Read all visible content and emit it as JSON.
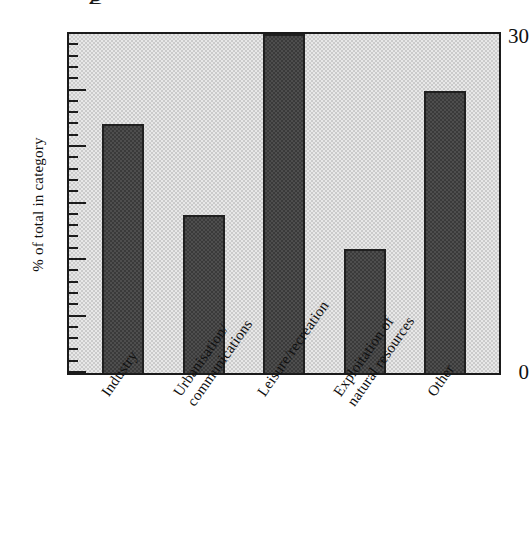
{
  "chart_data": {
    "type": "bar",
    "title": "",
    "subtitle": "",
    "xlabel": "",
    "ylabel": "% of total in category",
    "ylim": [
      0,
      30
    ],
    "ytick_labels": [
      "0",
      "30"
    ],
    "ytick_values": [
      0,
      30
    ],
    "minor_tick_step": 1,
    "major_tick_step": 5,
    "grid": false,
    "legend": null,
    "categories": [
      "Industry",
      "Urbanisation/\ncommunications",
      "Leisure/recreation",
      "Exploitation of\nnatural resources",
      "Other"
    ],
    "values": [
      22,
      14,
      30,
      11,
      25
    ],
    "bar_color": "#3a3a3a",
    "plot_background": "#cbcbcb",
    "axis_color": "#1b1b1b"
  },
  "axes": {
    "y_axis_label": "% of total in category",
    "y_top_label": "30",
    "y_zero_label": "0"
  },
  "categories": {
    "c0_line1": "Industry",
    "c0_line2": "",
    "c1_line1": "Urbanisation/",
    "c1_line2": "communications",
    "c2_line1": "Leisure/recreation",
    "c2_line2": "",
    "c3_line1": "Exploitation of",
    "c3_line2": "natural resources",
    "c4_line1": "Other",
    "c4_line2": ""
  },
  "artifacts": {
    "top_partial_glyph": "g"
  }
}
